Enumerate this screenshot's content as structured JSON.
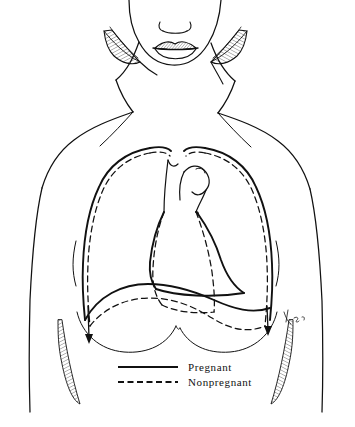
{
  "figure": {
    "background_color": "#ffffff",
    "ink_color": "#111111",
    "signature": "SG"
  },
  "legend": {
    "items": [
      {
        "key": "pregnant",
        "label": "Pregnant",
        "line_style": "solid"
      },
      {
        "key": "nonpregnant",
        "label": "Nonpregnant",
        "line_style": "dashed"
      }
    ]
  },
  "anatomy": {
    "parts": [
      {
        "key": "face",
        "label": "Lower face"
      },
      {
        "key": "nose",
        "label": "Nose"
      },
      {
        "key": "lips",
        "label": "Lips"
      },
      {
        "key": "neck",
        "label": "Neck"
      },
      {
        "key": "hair-left",
        "label": "Hair lock, left"
      },
      {
        "key": "hair-right",
        "label": "Hair lock, right"
      },
      {
        "key": "shoulder-left",
        "label": "Left shoulder and arm"
      },
      {
        "key": "shoulder-right",
        "label": "Right shoulder and arm"
      },
      {
        "key": "clavicle-left",
        "label": "Left clavicle"
      },
      {
        "key": "clavicle-right",
        "label": "Right clavicle"
      },
      {
        "key": "breast-left",
        "label": "Left breast"
      },
      {
        "key": "breast-right",
        "label": "Right breast"
      },
      {
        "key": "ribcage-pregnant",
        "label": "Rib cage outline, pregnant"
      },
      {
        "key": "ribcage-nonpregnant",
        "label": "Rib cage outline, nonpregnant"
      },
      {
        "key": "diaphragm-pregnant",
        "label": "Diaphragm level, pregnant"
      },
      {
        "key": "diaphragm-nonpregnant",
        "label": "Diaphragm level, nonpregnant"
      },
      {
        "key": "heart-pregnant",
        "label": "Cardiac silhouette, pregnant"
      },
      {
        "key": "heart-nonpregnant",
        "label": "Cardiac silhouette, nonpregnant"
      },
      {
        "key": "trachea",
        "label": "Trachea"
      },
      {
        "key": "aortic-arch",
        "label": "Aortic arch and great vessels"
      },
      {
        "key": "arrow-left",
        "label": "Level indicator arrow, left"
      },
      {
        "key": "arrow-right",
        "label": "Level indicator arrow, right"
      }
    ]
  }
}
